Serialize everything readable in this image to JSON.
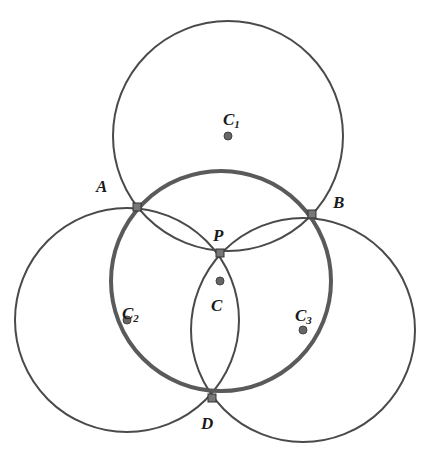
{
  "figure": {
    "background": "#ffffff",
    "colors": {
      "thin_circle": "#4a4a4a",
      "thick_circle": "#5a5a5a",
      "point_fill": "#666666",
      "point_stroke": "#333333",
      "label": "#1a1a1a"
    },
    "circles": [
      {
        "name": "C1",
        "cx": 228,
        "cy": 136,
        "r": 115,
        "thick": false
      },
      {
        "name": "C2",
        "cx": 127,
        "cy": 320,
        "r": 112,
        "thick": false
      },
      {
        "name": "C3",
        "cx": 303,
        "cy": 330,
        "r": 112,
        "thick": false
      },
      {
        "name": "C",
        "cx": 221,
        "cy": 281,
        "r": 110,
        "thick": true
      }
    ],
    "points": [
      {
        "id": "A",
        "x": 137,
        "y": 207
      },
      {
        "id": "B",
        "x": 312,
        "y": 214
      },
      {
        "id": "P",
        "x": 220,
        "y": 253
      },
      {
        "id": "D",
        "x": 212,
        "y": 398
      },
      {
        "id": "C",
        "x": 220,
        "y": 281
      },
      {
        "id": "C1",
        "x": 228,
        "y": 136
      },
      {
        "id": "C2",
        "x": 127,
        "y": 320
      },
      {
        "id": "C3",
        "x": 303,
        "y": 330
      }
    ],
    "labels": {
      "A": {
        "text": "A",
        "x": 96,
        "y": 192
      },
      "B": {
        "text": "B",
        "x": 333,
        "y": 208
      },
      "P": {
        "text": "P",
        "x": 213,
        "y": 241
      },
      "D": {
        "text": "D",
        "x": 201,
        "y": 429
      },
      "C": {
        "text": "C",
        "x": 211,
        "y": 311
      },
      "C1": {
        "text": "C",
        "sub": "1",
        "x": 223,
        "y": 125
      },
      "C2": {
        "text": "C",
        "sub": "2",
        "x": 122,
        "y": 319
      },
      "C3": {
        "text": "C",
        "sub": "3",
        "x": 295,
        "y": 321
      }
    }
  }
}
